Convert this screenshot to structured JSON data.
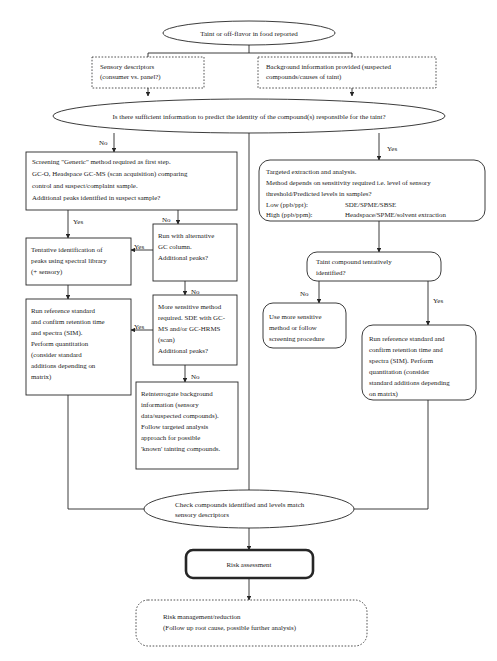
{
  "diagram": {
    "colors": {
      "stroke": "#262626",
      "fill": "#ffffff",
      "text": "#1a1a1a"
    }
  },
  "nodes": {
    "start": {
      "shape": "ellipse",
      "lines": [
        "Taint or off-flavor in food reported"
      ]
    },
    "sensory_descriptors": {
      "shape": "dashed-rect",
      "lines": [
        "Sensory descriptors",
        "(consumer vs. panel?)"
      ]
    },
    "background_info": {
      "shape": "dashed-rect",
      "lines": [
        "Background information provided (suspected",
        "compounds/causes of taint)"
      ]
    },
    "sufficient_info": {
      "shape": "ellipse",
      "lines": [
        "Is there sufficient information to predict the identity of the compound(s) responsible for the taint?"
      ]
    },
    "screening_generic": {
      "shape": "rect",
      "lines": [
        "Screening \"Generic\" method required as first step.",
        "GC-O, Headspace GC-MS (scan acquisition) comparing",
        "control and suspect/complaint sample.",
        "Additional peaks identified in suspect sample?"
      ]
    },
    "targeted_extraction": {
      "shape": "rounded-rect",
      "lines": [
        "Targeted extraction and analysis.",
        "Method depends on sensitivity required i.e. level of sensory",
        "threshold/Predicted levels in samples?"
      ],
      "table_rows": [
        {
          "label": "Low (ppb/ppt):",
          "value": "SDE/SPME/SBSE"
        },
        {
          "label": "High (ppb/ppm):",
          "value": "Headspace/SPME/solvent extraction"
        }
      ]
    },
    "tentative_id": {
      "shape": "rect",
      "lines": [
        "Tentative identification of",
        "peaks using spectral library",
        "(+ sensory)"
      ]
    },
    "alternative_column": {
      "shape": "rect",
      "lines": [
        "Run with alternative",
        "GC column.",
        "Additional peaks?"
      ]
    },
    "run_reference_left": {
      "shape": "rect",
      "lines": [
        "Run reference standard",
        "and confirm retention time",
        "and spectra (SIM).",
        "Perform quantitation",
        "(consider standard",
        "additions depending on",
        "matrix)"
      ]
    },
    "more_sensitive_method": {
      "shape": "rect",
      "lines": [
        "More sensitive method",
        "required. SDE with GC-",
        "MS and/or GC-HRMS",
        "(scan)",
        "Additional peaks?"
      ]
    },
    "reinterrogate": {
      "shape": "rect",
      "lines": [
        "Reinterrogate background",
        "information (sensory",
        "data/suspected compounds).",
        "Follow targeted analysis",
        "approach for possible",
        "'known' tainting compounds."
      ]
    },
    "taint_tentatively_identified": {
      "shape": "rounded-rect",
      "lines": [
        "Taint compound tentatively",
        "identified?"
      ]
    },
    "use_more_sensitive": {
      "shape": "rounded-rect",
      "lines": [
        "Use more sensitive",
        "method or follow",
        "screening procedure"
      ]
    },
    "run_reference_right": {
      "shape": "rounded-rect",
      "lines": [
        "Run reference standard and",
        "confirm retention time and",
        "spectra (SIM). Perform",
        "quantitation (consider",
        "standard additions depending",
        "on matrix)"
      ]
    },
    "check_compounds": {
      "shape": "ellipse",
      "lines": [
        "Check compounds identified and levels match",
        "sensory descriptors"
      ]
    },
    "risk_assessment": {
      "shape": "thick-rounded-rect",
      "lines": [
        "Risk assessment"
      ]
    },
    "risk_management": {
      "shape": "dashed-rounded-rect",
      "lines": [
        "Risk management/reduction",
        "(Follow up root cause, possible further analysis)"
      ]
    }
  },
  "edge_labels": {
    "sufficient_no": "No",
    "sufficient_yes": "Yes",
    "screening_yes": "Yes",
    "screening_no": "No",
    "alternative_yes": "Yes",
    "alternative_no": "No",
    "sensitive_yes": "Yes",
    "sensitive_no": "No",
    "taint_no": "No",
    "taint_yes": "Yes"
  }
}
